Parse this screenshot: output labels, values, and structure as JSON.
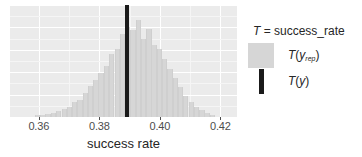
{
  "chart_data": {
    "type": "bar",
    "title": "",
    "xlabel": "success rate",
    "ylabel": "",
    "xlim": [
      0.3505,
      0.4255
    ],
    "ylim": [
      0,
      1
    ],
    "grid": true,
    "legend_position": "right",
    "tick_labels": [
      "0.36",
      "0.38",
      "0.40",
      "0.42"
    ],
    "tick_values": [
      0.36,
      0.38,
      0.4,
      0.42
    ],
    "minor_tick_values": [
      0.37,
      0.39,
      0.41
    ],
    "bin_width": 0.00175,
    "categories": [
      0.3596,
      0.3614,
      0.3631,
      0.3649,
      0.3666,
      0.3684,
      0.3701,
      0.3719,
      0.3736,
      0.3754,
      0.3771,
      0.3789,
      0.3806,
      0.3824,
      0.3841,
      0.3859,
      0.3876,
      0.3894,
      0.3911,
      0.3929,
      0.3946,
      0.3964,
      0.3981,
      0.3999,
      0.4016,
      0.4034,
      0.4051,
      0.4069,
      0.4086,
      0.4104,
      0.4121,
      0.4139,
      0.4156,
      0.4174
    ],
    "values": [
      0.015,
      0.022,
      0.03,
      0.038,
      0.055,
      0.075,
      0.085,
      0.13,
      0.15,
      0.215,
      0.275,
      0.33,
      0.395,
      0.455,
      0.56,
      0.61,
      0.745,
      0.8,
      0.775,
      0.87,
      0.7,
      0.79,
      0.64,
      0.61,
      0.52,
      0.43,
      0.35,
      0.27,
      0.19,
      0.135,
      0.09,
      0.06,
      0.035,
      0.02
    ],
    "observed_value": 0.3893,
    "series": [
      {
        "name": "T(y_rep)",
        "type": "histogram",
        "color": "#d6d6d6"
      },
      {
        "name": "T(y)",
        "type": "vline",
        "color": "#1a1a1a"
      }
    ]
  },
  "panel": {
    "background_color": "#ebebeb",
    "gridline_color": "#ffffff"
  },
  "axis": {
    "x_title": "success rate",
    "tick_label_color": "#4d4d4d",
    "ticks": [
      {
        "label": "0.36",
        "value": 0.36
      },
      {
        "label": "0.38",
        "value": 0.38
      },
      {
        "label": "0.40",
        "value": 0.4
      },
      {
        "label": "0.42",
        "value": 0.42
      }
    ]
  },
  "legend": {
    "title_t": "T",
    "title_rest": " = success_rate",
    "items": [
      {
        "key_type": "fill",
        "color": "#d6d6d6",
        "label_t": "T",
        "label_open": "(",
        "label_var": "y",
        "label_sub": "rep",
        "label_close": ")"
      },
      {
        "key_type": "line",
        "color": "#1a1a1a",
        "label_t": "T",
        "label_open": "(",
        "label_var": "y",
        "label_sub": "",
        "label_close": ")"
      }
    ]
  }
}
